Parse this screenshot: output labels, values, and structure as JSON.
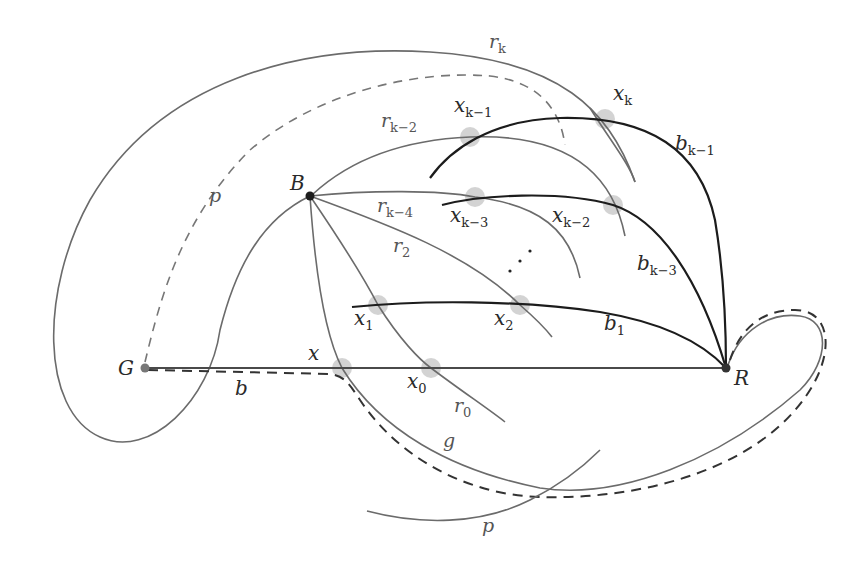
{
  "diagram": {
    "vertices": [
      {
        "id": "G",
        "label": "G",
        "x": 145,
        "y": 368
      },
      {
        "id": "B",
        "label": "B",
        "x": 310,
        "y": 196
      },
      {
        "id": "R",
        "label": "R",
        "x": 726,
        "y": 368
      }
    ],
    "crossing_points": [
      {
        "id": "x",
        "label": "x"
      },
      {
        "id": "x0",
        "label": "x",
        "sub": "0"
      },
      {
        "id": "x1",
        "label": "x",
        "sub": "1"
      },
      {
        "id": "x2",
        "label": "x",
        "sub": "2"
      },
      {
        "id": "xk3",
        "label": "x",
        "sub": "k−3"
      },
      {
        "id": "xk2",
        "label": "x",
        "sub": "k−2"
      },
      {
        "id": "xk1",
        "label": "x",
        "sub": "k−1"
      },
      {
        "id": "xk",
        "label": "x",
        "sub": "k"
      }
    ],
    "edge_labels": {
      "r_k": {
        "main": "r",
        "sub": "k"
      },
      "r_k2": {
        "main": "r",
        "sub": "k−2"
      },
      "r_k4": {
        "main": "r",
        "sub": "k−4"
      },
      "r_2": {
        "main": "r",
        "sub": "2"
      },
      "r_0": {
        "main": "r",
        "sub": "0"
      },
      "b_k1": {
        "main": "b",
        "sub": "k−1"
      },
      "b_k3": {
        "main": "b",
        "sub": "k−3"
      },
      "b_1": {
        "main": "b",
        "sub": "1"
      },
      "b": {
        "main": "b"
      },
      "g": {
        "main": "g"
      },
      "p_top": {
        "main": "p"
      },
      "p_bottom": {
        "main": "p"
      }
    },
    "ellipsis": "⋰",
    "colors": {
      "background": "#ffffff",
      "gray_edge": "#6b6b6b",
      "dark_edge": "#1c1c1c",
      "halo": "#c8c8c8"
    }
  }
}
